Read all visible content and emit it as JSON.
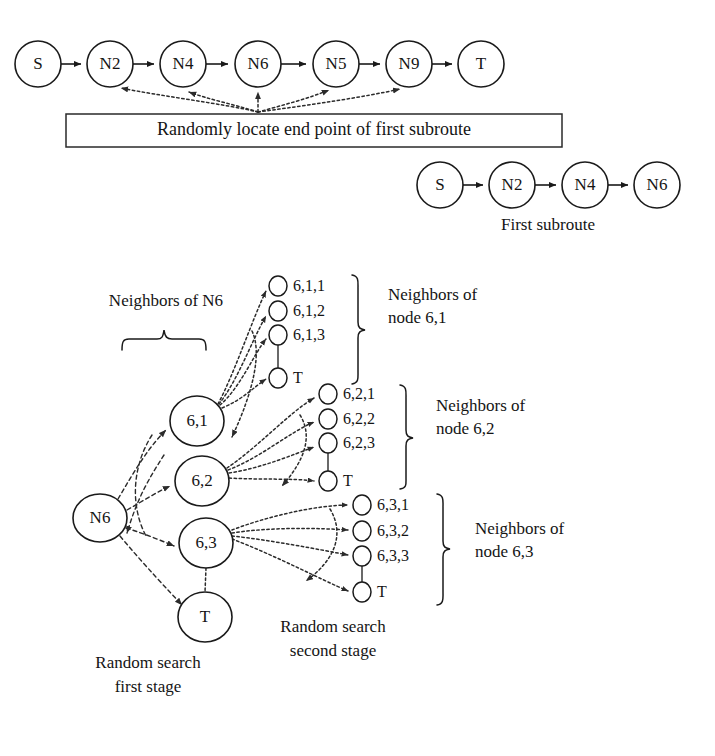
{
  "figure": {
    "colors": {
      "stroke": "#1a1a1a",
      "background": "#ffffff",
      "dotted": "#2b2b2b"
    }
  },
  "full_route": {
    "nodes": [
      {
        "id": "n-s",
        "label": "S",
        "cx": 38,
        "cy": 64,
        "r": 23
      },
      {
        "id": "n-n2",
        "label": "N2",
        "cx": 110,
        "cy": 64,
        "r": 23
      },
      {
        "id": "n-n4",
        "label": "N4",
        "cx": 183,
        "cy": 64,
        "r": 23
      },
      {
        "id": "n-n6",
        "label": "N6",
        "cx": 258,
        "cy": 64,
        "r": 23
      },
      {
        "id": "n-n5",
        "label": "N5",
        "cx": 336,
        "cy": 64,
        "r": 23
      },
      {
        "id": "n-n9",
        "label": "N9",
        "cx": 409,
        "cy": 64,
        "r": 23
      },
      {
        "id": "n-t",
        "label": "T",
        "cx": 481,
        "cy": 64,
        "r": 23
      }
    ]
  },
  "callout_box": {
    "text": "Randomly locate end point of first subroute",
    "x": 66,
    "y": 114,
    "width": 496,
    "height": 33,
    "targets": [
      "N2",
      "N4",
      "N6",
      "N5",
      "N9"
    ]
  },
  "first_subroute": {
    "caption": "First subroute",
    "nodes": [
      {
        "id": "sub-s",
        "label": "S",
        "cx": 440,
        "cy": 185,
        "r": 23
      },
      {
        "id": "sub-n2",
        "label": "N2",
        "cx": 512,
        "cy": 185,
        "r": 23
      },
      {
        "id": "sub-n4",
        "label": "N4",
        "cx": 585,
        "cy": 185,
        "r": 23
      },
      {
        "id": "sub-n6",
        "label": "N6",
        "cx": 657,
        "cy": 185,
        "r": 23
      }
    ],
    "caption_x": 548,
    "caption_y": 226
  },
  "search_tree": {
    "root": {
      "id": "tree-n6",
      "label": "N6",
      "cx": 100,
      "cy": 518,
      "rx": 27,
      "ry": 24
    },
    "level1": [
      {
        "id": "tree-61",
        "label": "6,1",
        "cx": 197,
        "cy": 421,
        "rx": 27,
        "ry": 25
      },
      {
        "id": "tree-62",
        "label": "6,2",
        "cx": 202,
        "cy": 481,
        "rx": 27,
        "ry": 25
      },
      {
        "id": "tree-63",
        "label": "6,3",
        "cx": 206,
        "cy": 543,
        "rx": 27,
        "ry": 25
      },
      {
        "id": "tree-t",
        "label": "T",
        "cx": 205,
        "cy": 617,
        "rx": 27,
        "ry": 25
      }
    ],
    "groups": [
      {
        "id": "group-61",
        "parent": "tree-61",
        "bracket_label_line1": "Neighbors of",
        "bracket_label_line2": "node 6,1",
        "label_x": 388,
        "label_y1": 296,
        "label_y2": 319,
        "brace_x": 358,
        "brace_top": 275,
        "brace_bottom": 384,
        "items": [
          {
            "label": "6,1,1",
            "cx": 278,
            "cy": 286,
            "rx": 9,
            "ry": 10
          },
          {
            "label": "6,1,2",
            "cx": 278,
            "cy": 311,
            "rx": 9,
            "ry": 10
          },
          {
            "label": "6,1,3",
            "cx": 278,
            "cy": 335,
            "rx": 9,
            "ry": 10
          },
          {
            "label": "T",
            "cx": 278,
            "cy": 378,
            "rx": 9,
            "ry": 10
          }
        ]
      },
      {
        "id": "group-62",
        "parent": "tree-62",
        "bracket_label_line1": "Neighbors of",
        "bracket_label_line2": "node 6,2",
        "label_x": 436,
        "label_y1": 407,
        "label_y2": 430,
        "brace_x": 406,
        "brace_top": 385,
        "brace_bottom": 489,
        "items": [
          {
            "label": "6,2,1",
            "cx": 328,
            "cy": 394,
            "rx": 9,
            "ry": 10
          },
          {
            "label": "6,2,2",
            "cx": 328,
            "cy": 419,
            "rx": 9,
            "ry": 10
          },
          {
            "label": "6,2,3",
            "cx": 328,
            "cy": 443,
            "rx": 9,
            "ry": 10
          },
          {
            "label": "T",
            "cx": 328,
            "cy": 481,
            "rx": 9,
            "ry": 10
          }
        ]
      },
      {
        "id": "group-63",
        "parent": "tree-63",
        "bracket_label_line1": "Neighbors of",
        "bracket_label_line2": "node 6,3",
        "label_x": 475,
        "label_y1": 530,
        "label_y2": 553,
        "brace_x": 443,
        "brace_top": 494,
        "brace_bottom": 605,
        "items": [
          {
            "label": "6,3,1",
            "cx": 362,
            "cy": 505,
            "rx": 9,
            "ry": 10
          },
          {
            "label": "6,3,2",
            "cx": 362,
            "cy": 531,
            "rx": 9,
            "ry": 10
          },
          {
            "label": "6,3,3",
            "cx": 362,
            "cy": 556,
            "rx": 9,
            "ry": 10
          },
          {
            "label": "T",
            "cx": 362,
            "cy": 592,
            "rx": 9,
            "ry": 10
          }
        ]
      }
    ],
    "neighbors_of_n6": {
      "label": "Neighbors of N6",
      "label_x": 100,
      "label_y": 302,
      "brace_left": 122,
      "brace_right": 206,
      "brace_y": 345,
      "brace_tip_y": 328
    },
    "captions": [
      {
        "id": "caption-first-stage",
        "line1": "Random search",
        "line2": "first stage",
        "x": 148,
        "y1": 664,
        "y2": 688
      },
      {
        "id": "caption-second-stage",
        "line1": "Random search",
        "line2": "second stage",
        "x": 333,
        "y1": 628,
        "y2": 652
      }
    ]
  }
}
